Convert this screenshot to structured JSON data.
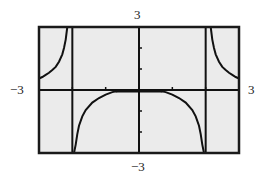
{
  "chart_data": {
    "type": "line",
    "title": "",
    "xlabel": "",
    "ylabel": "",
    "xlim": [
      -3,
      3
    ],
    "ylim": [
      -3,
      3
    ],
    "grid": false,
    "x_tick_step": 1,
    "y_tick_step": 1,
    "window_labels": {
      "xmin": "−3",
      "xmax": "3",
      "ymin": "−3",
      "ymax": "3"
    },
    "vertical_asymptotes": [
      -2,
      2
    ],
    "series": [
      {
        "name": "left-outer-branch",
        "points": [
          [
            -3,
            0.55
          ],
          [
            -2.9,
            0.62
          ],
          [
            -2.8,
            0.72
          ],
          [
            -2.7,
            0.82
          ],
          [
            -2.6,
            0.95
          ],
          [
            -2.5,
            1.1
          ],
          [
            -2.4,
            1.35
          ],
          [
            -2.3,
            1.7
          ],
          [
            -2.25,
            2.0
          ],
          [
            -2.2,
            2.4
          ],
          [
            -2.15,
            3.0
          ]
        ]
      },
      {
        "name": "middle-branch",
        "points": [
          [
            -1.95,
            -3.0
          ],
          [
            -1.9,
            -2.6
          ],
          [
            -1.85,
            -2.1
          ],
          [
            -1.8,
            -1.7
          ],
          [
            -1.7,
            -1.25
          ],
          [
            -1.6,
            -0.95
          ],
          [
            -1.4,
            -0.6
          ],
          [
            -1.2,
            -0.38
          ],
          [
            -1.0,
            -0.22
          ],
          [
            -0.8,
            -0.1
          ],
          [
            -0.6,
            -0.04
          ],
          [
            -0.4,
            -0.01
          ],
          [
            0,
            0
          ],
          [
            0.4,
            -0.01
          ],
          [
            0.6,
            -0.04
          ],
          [
            0.8,
            -0.1
          ],
          [
            1.0,
            -0.22
          ],
          [
            1.2,
            -0.38
          ],
          [
            1.4,
            -0.6
          ],
          [
            1.6,
            -0.95
          ],
          [
            1.7,
            -1.25
          ],
          [
            1.8,
            -1.7
          ],
          [
            1.85,
            -2.1
          ],
          [
            1.9,
            -2.6
          ],
          [
            1.95,
            -3.0
          ]
        ]
      },
      {
        "name": "right-outer-branch",
        "points": [
          [
            2.15,
            3.0
          ],
          [
            2.2,
            2.4
          ],
          [
            2.25,
            2.0
          ],
          [
            2.3,
            1.7
          ],
          [
            2.4,
            1.35
          ],
          [
            2.5,
            1.1
          ],
          [
            2.6,
            0.95
          ],
          [
            2.7,
            0.82
          ],
          [
            2.8,
            0.72
          ],
          [
            2.9,
            0.62
          ],
          [
            3,
            0.55
          ]
        ]
      }
    ]
  },
  "colors": {
    "frame": "#1a1a1a",
    "background": "#ebebeb",
    "curve": "#111111",
    "axis": "#111111"
  }
}
